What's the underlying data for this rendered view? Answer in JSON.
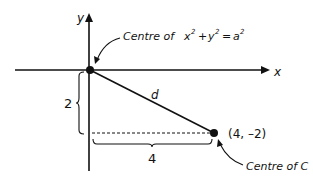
{
  "diagram": {
    "axes": {
      "x_label": "x",
      "y_label": "y"
    },
    "origin_label": {
      "prefix": "Centre of",
      "equation_x": "x",
      "equation_plus": "+",
      "equation_y": "y",
      "equation_eq": "=",
      "equation_a": "a",
      "exp": "2"
    },
    "point_label": "(4, –2)",
    "point_caption": "Centre of C",
    "segment_label": "d",
    "vertical_measure": "2",
    "horizontal_measure": "4",
    "colors": {
      "stroke": "#111111",
      "background": "#ffffff"
    }
  }
}
